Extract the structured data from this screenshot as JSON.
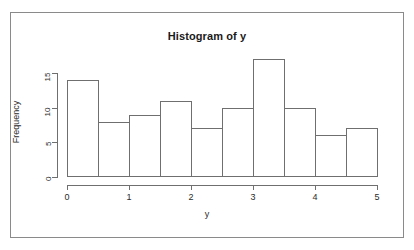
{
  "chart_data": {
    "type": "bar",
    "title": "Histogram of y",
    "xlabel": "y",
    "ylabel": "Frequency",
    "categories": [
      "0-0.5",
      "0.5-1",
      "1-1.5",
      "1.5-2",
      "2-2.5",
      "2.5-3",
      "3-3.5",
      "3.5-4",
      "4-4.5",
      "4.5-5"
    ],
    "bin_edges": [
      0,
      0.5,
      1,
      1.5,
      2,
      2.5,
      3,
      3.5,
      4,
      4.5,
      5
    ],
    "values": [
      14,
      8,
      9,
      11,
      7,
      10,
      17,
      10,
      6,
      7
    ],
    "xlim": [
      0,
      5
    ],
    "ylim": [
      0,
      17
    ],
    "x_ticks": [
      0,
      1,
      2,
      3,
      4,
      5
    ],
    "x_tick_labels": [
      "0",
      "1",
      "2",
      "3",
      "4",
      "5"
    ],
    "y_ticks": [
      0,
      5,
      10,
      15
    ],
    "y_tick_labels": [
      "0",
      "5",
      "10",
      "15"
    ],
    "grid": false,
    "legend": false,
    "bar_fill": "#ffffff",
    "bar_border": "#6f6f6f",
    "axis_color": "#6f6f6f",
    "text_color": "#2b2b2b",
    "frame_color": "#8a8a8a",
    "background": "#ffffff"
  },
  "labels": {
    "title": "Histogram of y",
    "x_axis_title": "y",
    "y_axis_title": "Frequency"
  }
}
